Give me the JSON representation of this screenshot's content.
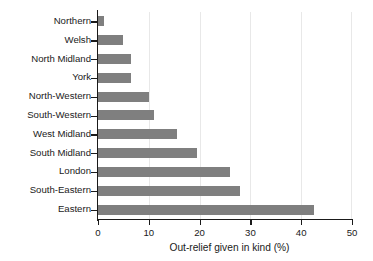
{
  "chart_data": {
    "type": "bar",
    "orientation": "horizontal",
    "title": "",
    "subtitle": "",
    "xlabel": "Out-relief given in kind (%)",
    "ylabel": "",
    "categories": [
      "Northern",
      "Welsh",
      "North Midland",
      "York",
      "North-Western",
      "South-Western",
      "West Midland",
      "South Midland",
      "London",
      "South-Eastern",
      "Eastern"
    ],
    "values": [
      1.2,
      4.9,
      6.4,
      6.5,
      10.0,
      11.0,
      15.5,
      19.5,
      26.0,
      28.0,
      42.5
    ],
    "xlim": [
      0,
      50
    ],
    "xticks": [
      0,
      10,
      20,
      30,
      40,
      50
    ],
    "xticklabels": [
      "0",
      "10",
      "20",
      "30",
      "40",
      "50"
    ],
    "grid": "vertical",
    "legend": "none",
    "bar_color": "#7f7f7f",
    "grid_color": "#e8e8e8",
    "axis_color": "#1a1a1a",
    "background": "#ffffff"
  }
}
